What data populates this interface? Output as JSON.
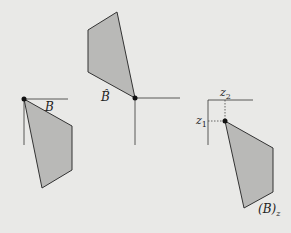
{
  "diagram": {
    "background": "#e9e9e7",
    "fill_color": "#b9b9b7",
    "stroke_color": "#333333",
    "figures": [
      {
        "id": "B",
        "label": "B",
        "polygon": [
          [
            24,
            99
          ],
          [
            72,
            126
          ],
          [
            72,
            170
          ],
          [
            42,
            188
          ]
        ],
        "origin": [
          24,
          99
        ],
        "axes": {
          "horizontal_end": 68,
          "vertical_end": 145
        }
      },
      {
        "id": "B-hat",
        "label": "B̂",
        "polygon": [
          [
            117,
            12
          ],
          [
            135,
            98
          ],
          [
            88,
            72
          ],
          [
            88,
            30
          ]
        ],
        "origin": [
          135,
          98
        ],
        "axes": {
          "horizontal_end": 180,
          "vertical_end": 145
        }
      },
      {
        "id": "B-z",
        "label": "(B)",
        "label_subscript": "z",
        "polygon": [
          [
            225,
            121
          ],
          [
            273,
            148
          ],
          [
            273,
            192
          ],
          [
            244,
            208
          ]
        ],
        "origin": [
          208,
          100
        ],
        "point": [
          225,
          121
        ],
        "coord_labels": {
          "z1": "z",
          "z1_sub": "1",
          "z2": "z",
          "z2_sub": "2"
        }
      }
    ]
  }
}
